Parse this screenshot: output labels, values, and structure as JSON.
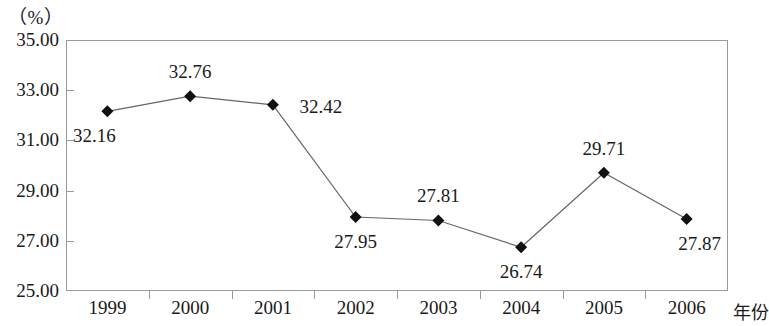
{
  "chart_data": {
    "type": "line",
    "title": "",
    "xlabel": "年份",
    "ylabel": "（%）",
    "categories": [
      "1999",
      "2000",
      "2001",
      "2002",
      "2003",
      "2004",
      "2005",
      "2006"
    ],
    "values": [
      32.16,
      32.76,
      32.42,
      27.95,
      27.81,
      26.74,
      29.71,
      27.87
    ],
    "value_labels": [
      "32.16",
      "32.76",
      "32.42",
      "27.95",
      "27.81",
      "26.74",
      "29.71",
      "27.87"
    ],
    "label_positions": [
      "below-left",
      "above",
      "right",
      "below",
      "above",
      "below",
      "above",
      "below-right"
    ],
    "ylim": [
      25.0,
      35.0
    ],
    "ytick_labels": [
      "35.00",
      "33.00",
      "31.00",
      "29.00",
      "27.00",
      "25.00"
    ],
    "ytick_values": [
      35.0,
      33.0,
      31.0,
      29.0,
      27.0,
      25.0
    ],
    "grid": false,
    "legend": "none",
    "marker": "diamond",
    "series_color": "#666666",
    "marker_color": "#111111",
    "frame_color": "#9a9a9a"
  },
  "axes": {
    "unit_label": "（%）",
    "x_axis_name": "年份"
  }
}
